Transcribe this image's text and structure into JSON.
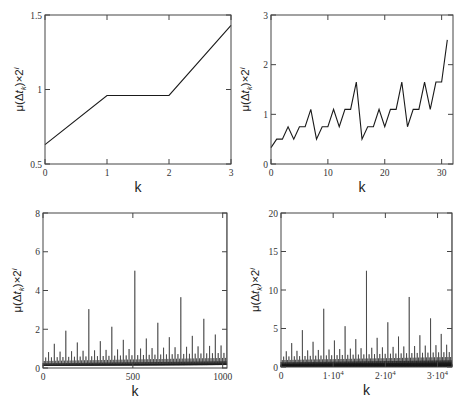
{
  "figure": {
    "caption_fragment": ""
  },
  "chart_data": [
    {
      "id": "tl",
      "type": "line",
      "xlabel": "k",
      "ylabel": "μ(Δt_k)×2^i",
      "xlim": [
        0,
        3
      ],
      "ylim": [
        0.5,
        1.5
      ],
      "xticks": [
        0,
        1,
        2,
        3
      ],
      "xtick_labels": [
        "0",
        "1",
        "2",
        "3"
      ],
      "yticks": [
        0.5,
        1,
        1.5
      ],
      "ytick_labels": [
        "0.5",
        "1",
        "1.5"
      ],
      "x": [
        0,
        1,
        2,
        3
      ],
      "values": [
        0.63,
        0.96,
        0.96,
        1.43
      ],
      "grid": false,
      "frame": {
        "left": 45,
        "top": 15,
        "right": 231,
        "bottom": 164
      }
    },
    {
      "id": "tr",
      "type": "line",
      "xlabel": "k",
      "ylabel": "μ(Δt_k)×2^i",
      "xlim": [
        0,
        32
      ],
      "ylim": [
        0,
        3
      ],
      "xticks": [
        0,
        10,
        20,
        30
      ],
      "xtick_labels": [
        "0",
        "10",
        "20",
        "30"
      ],
      "yticks": [
        0,
        1,
        2,
        3
      ],
      "ytick_labels": [
        "0",
        "1",
        "2",
        "3"
      ],
      "x": [
        0,
        1,
        2,
        3,
        4,
        5,
        6,
        7,
        8,
        9,
        10,
        11,
        12,
        13,
        14,
        15,
        16,
        17,
        18,
        19,
        20,
        21,
        22,
        23,
        24,
        25,
        26,
        27,
        28,
        29,
        30,
        31
      ],
      "values": [
        0.33,
        0.5,
        0.5,
        0.75,
        0.5,
        0.75,
        0.75,
        1.1,
        0.5,
        0.75,
        0.75,
        1.1,
        0.75,
        1.1,
        1.1,
        1.65,
        0.5,
        0.75,
        0.75,
        1.1,
        0.75,
        1.1,
        1.1,
        1.65,
        0.75,
        1.1,
        1.1,
        1.65,
        1.1,
        1.65,
        1.65,
        2.5
      ],
      "grid": false,
      "frame": {
        "left": 271,
        "top": 15,
        "right": 453,
        "bottom": 164
      }
    },
    {
      "id": "bl",
      "type": "line",
      "xlabel": "k",
      "ylabel": "μ(Δt_k)×2^i",
      "xlim": [
        0,
        1024
      ],
      "ylim": [
        0,
        8
      ],
      "xticks": [
        0,
        500,
        1000
      ],
      "xtick_labels": [
        "0",
        "500",
        "1000"
      ],
      "yticks": [
        0,
        2,
        4,
        6,
        8
      ],
      "ytick_labels": [
        "0",
        "2",
        "4",
        "6",
        "8"
      ],
      "n_points": 1024,
      "series_rule": "base 0.33 scaled by 1.5^(trailing ones in binary k); peaks near 4.1 at k=511,767,1023",
      "approx_peak": 4.1,
      "grid": false,
      "frame": {
        "left": 43,
        "top": 213,
        "right": 227,
        "bottom": 368
      }
    },
    {
      "id": "br",
      "type": "line",
      "xlabel": "k",
      "ylabel": "μ(Δt_k)×2^i",
      "xlim": [
        0,
        32768
      ],
      "ylim": [
        0,
        20
      ],
      "xticks": [
        0,
        10000,
        20000,
        30000
      ],
      "xtick_labels": [
        "0",
        "1·10^4",
        "2·10^4",
        "3·10^4"
      ],
      "yticks": [
        0,
        5,
        10,
        15,
        20
      ],
      "ytick_labels": [
        "0",
        "5",
        "10",
        "15",
        "20"
      ],
      "n_points": 32768,
      "series_rule": "same self-similar rule as other panels; peaks near 10.2",
      "approx_peak": 10.2,
      "grid": false,
      "frame": {
        "left": 281,
        "top": 213,
        "right": 452,
        "bottom": 367
      }
    }
  ]
}
